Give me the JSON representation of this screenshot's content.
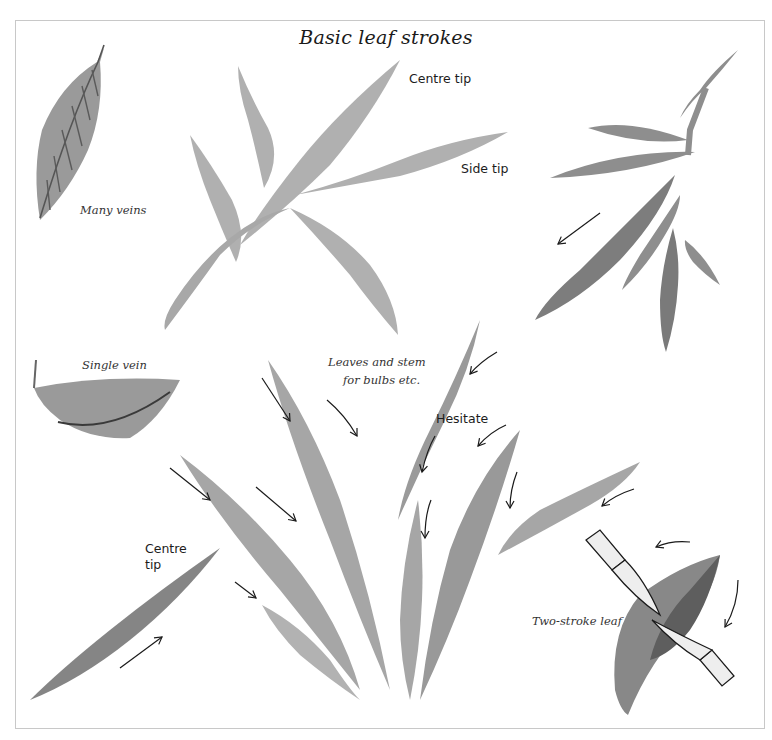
{
  "page": {
    "title": "Basic leaf strokes"
  },
  "labels": {
    "centre_tip_top": "Centre tip",
    "side_tip": "Side tip",
    "many_veins": "Many veins",
    "single_vein": "Single vein",
    "leaves_stem_line1": "Leaves and stem",
    "leaves_stem_line2": "for bulbs etc.",
    "hesitate": "Hesitate",
    "centre_tip_bottom_line1": "Centre",
    "centre_tip_bottom_line2": "tip",
    "two_stroke_leaf": "Two-stroke leaf"
  },
  "colors": {
    "ink_light": "#b4b4b4",
    "ink_mid": "#9a9a9a",
    "ink_dark": "#6e6e6e",
    "arrow": "#1a1a1a",
    "frame": "#c8c8c8",
    "brush_fill": "#eeeeee"
  }
}
